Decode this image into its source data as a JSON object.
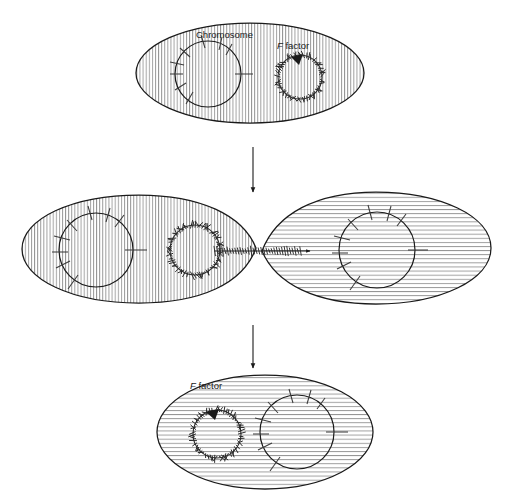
{
  "figure": {
    "background_color": "#ffffff",
    "ink_color": "#1a1a1a",
    "hatch_color": "#7a7a7a",
    "width": 509,
    "height": 496
  },
  "labels": {
    "chromosome": "Chromosome",
    "f_factor_italic": "F",
    "f_factor_rest": " factor"
  },
  "stages": [
    {
      "id": "stage-1",
      "name": "donor-cell-with-free-f-factor",
      "cell_count": 1,
      "cells": [
        {
          "name": "donor-cell",
          "hatch": "vertical",
          "cx": 250,
          "cy": 73,
          "rx": 114,
          "ry": 50,
          "chromosome": {
            "cx": 208,
            "cy": 74,
            "r": 33,
            "gene_ticks": 9
          },
          "f_factor": {
            "cx": 300,
            "cy": 77,
            "r": 22,
            "arrow": "clockwise"
          },
          "labels": [
            {
              "text_key": "chromosome",
              "x": 196,
              "y": 38,
              "italic_first": false
            },
            {
              "text_key": "f_factor",
              "x": 277,
              "y": 49,
              "italic_first": true
            }
          ]
        }
      ]
    },
    {
      "id": "stage-2",
      "name": "conjugating-pair-transferring-f-factor",
      "cell_count": 2,
      "cells": [
        {
          "name": "donor-cell",
          "hatch": "vertical",
          "cx": 139,
          "cy": 249,
          "rx": 117,
          "ry": 54,
          "chromosome": {
            "cx": 96,
            "cy": 250,
            "r": 37,
            "gene_ticks": 9
          },
          "f_factor": {
            "cx": 195,
            "cy": 250,
            "r": 25,
            "arrow": "none"
          },
          "labels": []
        },
        {
          "name": "recipient-cell",
          "hatch": "horizontal",
          "cx": 376,
          "cy": 248,
          "rx": 115,
          "ry": 56,
          "chromosome": {
            "cx": 377,
            "cy": 250,
            "r": 38,
            "gene_ticks": 9
          },
          "f_factor": null,
          "labels": []
        }
      ],
      "bridge": {
        "name": "conjugation-bridge",
        "x1": 256,
        "x2": 262,
        "y": 251,
        "dna_strand": {
          "x1": 214,
          "x2": 310,
          "y": 251,
          "arrowhead": "right"
        }
      }
    },
    {
      "id": "stage-3",
      "name": "recipient-cell-now-f-positive",
      "cell_count": 1,
      "cells": [
        {
          "name": "converted-cell",
          "hatch": "horizontal",
          "cx": 265,
          "cy": 432,
          "rx": 108,
          "ry": 57,
          "chromosome": {
            "cx": 297,
            "cy": 432,
            "r": 37,
            "gene_ticks": 9
          },
          "f_factor": {
            "cx": 217,
            "cy": 434,
            "r": 24,
            "arrow": "clockwise"
          },
          "labels": [
            {
              "text_key": "f_factor",
              "x": 190,
              "y": 389,
              "italic_first": true
            }
          ]
        }
      ]
    }
  ],
  "flow_arrows": [
    {
      "name": "arrow-stage1-to-stage2",
      "x": 253,
      "y1": 147,
      "y2": 192,
      "direction": "down"
    },
    {
      "name": "arrow-stage2-to-stage3",
      "x": 253,
      "y1": 325,
      "y2": 368,
      "direction": "down"
    }
  ]
}
